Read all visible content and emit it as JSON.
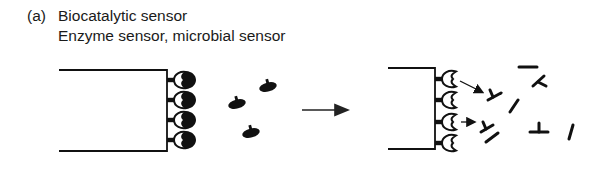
{
  "caption": {
    "label": "(a)",
    "title": "Biocatalytic sensor",
    "subtitle": "Enzyme sensor, microbial sensor"
  },
  "diagram": {
    "ink_color": "#111111",
    "left_state": {
      "description": "Electrode with immobilized receptors binding substrates",
      "receptor_count": 4,
      "free_substrate_count": 3
    },
    "transition": {
      "type": "arrow",
      "direction": "right"
    },
    "right_state": {
      "description": "Electrode with empty receptors releasing reaction products",
      "receptor_count": 4,
      "release_arrow_count": 2,
      "product_fragment_count": 8
    }
  }
}
